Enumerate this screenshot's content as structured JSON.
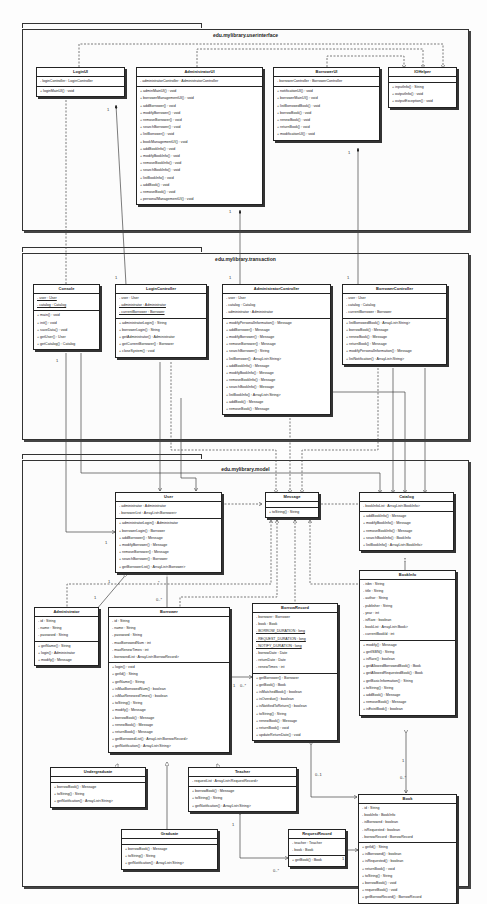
{
  "packages": {
    "ui": "edu.mylibrary.userinterface",
    "transaction": "edu.mylibrary.transaction",
    "model": "edu.mylibrary.model"
  },
  "classes": {
    "LoginUI": {
      "name": "LoginUI",
      "attrs": [
        "- loginController : LoginController"
      ],
      "ops": [
        "+ loginMainUI() : void"
      ]
    },
    "AdministratorUI": {
      "name": "AdministratorUI",
      "attrs": [
        "- administratorController : AdministratorController"
      ],
      "ops": [
        "+ adminMainUI() : void",
        "+ borrowerManagementUI() : void",
        "+ addBorrower() : void",
        "+ modifyBorrower() : void",
        "+ removeBorrower() : void",
        "+ searchBorrower() : void",
        "+ listBorrower() : void",
        "+ bookManagementUI() : void",
        "+ addBookInfo() : void",
        "+ modifyBookInfo() : void",
        "+ removeBookInfo() : void",
        "+ searchBookInfo() : void",
        "+ listBookInfo() : void",
        "+ addBook() : void",
        "+ removeBook() : void",
        "+ personalManagementUI() : void"
      ]
    },
    "BorrowerUI": {
      "name": "BorrowerUI",
      "attrs": [
        "- borrowerController : BorrowerController"
      ],
      "ops": [
        "+ notificationUI() : void",
        "+ borrowerMainUI() : void",
        "+ listBorrowedBook() : void",
        "+ borrowBook() : void",
        "+ renewBook() : void",
        "+ returnBook() : void",
        "+ modificationUI() : void"
      ]
    },
    "IOHelper": {
      "name": "IOHelper",
      "attrs": [],
      "ops": [
        "+ inputInfo() : String",
        "+ outputInfo() : void",
        "+ outputException() : void"
      ]
    },
    "Console": {
      "name": "Console",
      "attrs": [
        "- user : User",
        "- catalog : Catalog"
      ],
      "attrs_static": [
        true,
        true
      ],
      "ops": [
        "+ main() : void",
        "+ init() : void",
        "+ saveData() : void",
        "+ getUser() : User",
        "+ getCatalog() : Catalog"
      ]
    },
    "LoginController": {
      "name": "LoginController",
      "attrs": [
        "- user : User",
        "- administrator : Administrator",
        "- currentBorrower : Borrower"
      ],
      "attrs_static": [
        false,
        true,
        true
      ],
      "ops": [
        "+ administratorLogin() : String",
        "+ borrowerLogin() : String",
        "+ getAdministrator() : Administrator",
        "+ getCurrentBorrower() : Borrower",
        "+ closeSystem() : void"
      ]
    },
    "AdministratorController": {
      "name": "AdministratorController",
      "attrs": [
        "- user : User",
        "- catalog : Catalog",
        "- administrator : Administrator"
      ],
      "ops": [
        "+ modifyPersonalInformation() : Message",
        "+ addBorrower() : Message",
        "+ modifyBorrower() : Message",
        "+ removeBorrower() : Message",
        "+ searchBorrower() : String",
        "+ listBorrower() : ArrayList<String>",
        "+ addBookInfo() : Message",
        "+ modifyBookInfo() : Message",
        "+ removeBookInfo() : Message",
        "+ searchBookInfo() : Message",
        "+ listBookInfo() : ArrayList<String>",
        "+ addBook() : Message",
        "+ removeBook() : Message"
      ]
    },
    "BorrowerController": {
      "name": "BorrowerController",
      "attrs": [
        "- user : User",
        "- catalog : Catalog",
        "- currentBorrower : Borrower"
      ],
      "ops": [
        "+ listBorrowedBook() : ArrayList<String>",
        "+ borrowBook() : Message",
        "+ renewBook() : Message",
        "+ returnBook() : Message",
        "+ modifyPersonalInformation() : Message",
        "+ listNotification() : ArrayList<String>"
      ]
    },
    "User": {
      "name": "User",
      "attrs": [
        "- administrator : Administrator",
        "- borrowerList : ArrayList<Borrower>"
      ],
      "ops": [
        "+ administratorLogin() : Administrator",
        "+ borrowerLogin() : Borrower",
        "+ addBorrower() : Message",
        "+ modifyBorrower() : Message",
        "+ removeBorrower() : Message",
        "+ searchBorrower() : Borrower",
        "+ getBorrowerList() : ArrayList<Borrower>"
      ]
    },
    "Message": {
      "name": "Message",
      "attrs": [],
      "ops": [
        "+ toString() : String"
      ]
    },
    "Catalog": {
      "name": "Catalog",
      "attrs": [
        "- bookInfoList : ArrayList<BookInfo>"
      ],
      "ops": [
        "+ addBookInfo() : Message",
        "+ modifyBookInfo() : Message",
        "+ removeBookInfo() : Message",
        "+ searchBookInfo() : BookInfo",
        "+ listBookInfo() : ArrayList<BookInfo>"
      ]
    },
    "Administrator": {
      "name": "Administrator",
      "attrs": [
        "- id : String",
        "- name : String",
        "- password : String"
      ],
      "ops": [
        "+ getName() : String",
        "+ login() : Administrator",
        "+ modify() : Message"
      ]
    },
    "Borrower": {
      "name": "Borrower",
      "attrs": [
        "- id : String",
        "- name : String",
        "- password : String",
        "- maxBorrowedNum : int",
        "- maxRenewTimes : int",
        "- borrowedList : ArrayList<BorrowRecord>"
      ],
      "ops": [
        "+ login() : void",
        "+ getId() : String",
        "+ getName() : String",
        "+ isMaxBorrowedNum() : boolean",
        "+ isMaxRenewedTimes() : boolean",
        "+ toString() : String",
        "+ modify() : Message",
        "+ borrowBook() : Message",
        "+ renewBook() : Message",
        "+ returnBook() : Message",
        "+ getBorrowedList() : ArrayList<BorrowRecord>",
        "+ getNotification() : ArrayList<String>"
      ]
    },
    "BorrowRecord": {
      "name": "BorrowRecord",
      "attrs": [
        "- borrower : Borrower",
        "- book : Book",
        "- BORROW_DURATION : long",
        "- REQUEST_DURATION : long",
        "- NOTIFY_DURATION : long",
        "- borrowDate : Date",
        "- returnDate : Date",
        "- renewTimes : int"
      ],
      "attrs_static": [
        false,
        false,
        true,
        true,
        true,
        false,
        false,
        false
      ],
      "ops": [
        "+ getBorrower() : Borrower",
        "+ getBook() : Book",
        "+ isMatchedBook() : boolean",
        "+ isOverdue() : boolean",
        "+ isNotifiedToReturn() : boolean",
        "+ toString() : String",
        "+ renewBook() : Message",
        "+ returnBook() : void",
        "+ updateReturnDate() : void"
      ]
    },
    "BookInfo": {
      "name": "BookInfo",
      "attrs": [
        "- isbn : String",
        "- title : String",
        "- author : String",
        "- publisher : String",
        "- year : int",
        "- isRare : boolean",
        "- bookList : ArrayList<Book>",
        "- currentBookId : int"
      ],
      "ops": [
        "+ modify() : Message",
        "+ getISBN() : String",
        "+ isRare() : boolean",
        "+ getAllowedBorrowedBook() : Book",
        "+ getAllowedRequestedBook() : Book",
        "+ getBasicInformation() : String",
        "+ toString() : String",
        "+ addBook() : Message",
        "+ removeBook() : Message",
        "+ isExistBook() : boolean"
      ]
    },
    "Book": {
      "name": "Book",
      "attrs": [
        "- id : String",
        "- bookInfo : BookInfo",
        "- isBorrowed : boolean",
        "- isRequested : boolean",
        "- borrowRecord : BorrowRecord"
      ],
      "ops": [
        "+ getId() : String",
        "+ isBorrowed() : boolean",
        "+ isRequested() : boolean",
        "+ returnBook() : void",
        "+ toString() : String",
        "+ borrowBook() : void",
        "+ requestBook() : void",
        "+ getBorrowRecord() : BorrowRecord"
      ]
    },
    "Undergraduate": {
      "name": "Undergraduate",
      "attrs": [],
      "ops": [
        "+ borrowBook() : Message",
        "+ toString() : String",
        "+ getNotification() : ArrayList<String>"
      ]
    },
    "Teacher": {
      "name": "Teacher",
      "attrs": [
        "- requestList : ArrayList<RequestRecord>"
      ],
      "ops": [
        "+ borrowBook() : Message",
        "+ toString() : String",
        "+ getNotification() : ArrayList<String>"
      ]
    },
    "Graduate": {
      "name": "Graduate",
      "attrs": [],
      "ops": [
        "+ borrowBook() : Message",
        "+ toString() : String",
        "+ getNotification() : ArrayList<String>"
      ]
    },
    "RequestRecord": {
      "name": "RequestRecord",
      "attrs": [
        "- teacher : Teacher",
        "- book : Book"
      ],
      "ops": [
        "+ getBook() : Book"
      ]
    }
  },
  "multiplicities": [
    {
      "text": "1",
      "x": 107,
      "y": 107
    },
    {
      "text": "1",
      "x": 229,
      "y": 209
    },
    {
      "text": "1",
      "x": 348,
      "y": 150
    },
    {
      "text": "1",
      "x": 115,
      "y": 275
    },
    {
      "text": "1",
      "x": 229,
      "y": 275
    },
    {
      "text": "1",
      "x": 347,
      "y": 275
    },
    {
      "text": "1",
      "x": 56,
      "y": 358
    },
    {
      "text": "1",
      "x": 105,
      "y": 540
    },
    {
      "text": "1",
      "x": 108,
      "y": 579
    },
    {
      "text": "1",
      "x": 94,
      "y": 595
    },
    {
      "text": "*",
      "x": 158,
      "y": 580
    },
    {
      "text": "0..*",
      "x": 156,
      "y": 597
    },
    {
      "text": "1",
      "x": 233,
      "y": 683
    },
    {
      "text": "0..*",
      "x": 240,
      "y": 683
    },
    {
      "text": "1",
      "x": 402,
      "y": 758
    },
    {
      "text": "0..*",
      "x": 400,
      "y": 775
    },
    {
      "text": "0..1",
      "x": 315,
      "y": 772
    },
    {
      "text": "1",
      "x": 232,
      "y": 822
    },
    {
      "text": "0..*",
      "x": 273,
      "y": 868
    },
    {
      "text": "1 1",
      "x": 342,
      "y": 856
    }
  ]
}
